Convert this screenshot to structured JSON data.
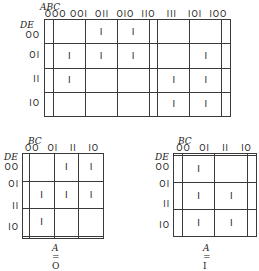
{
  "maps": [
    {
      "id": "five-variable",
      "col_var": "ABC",
      "row_var": "DE",
      "col_labels": [
        "OOO",
        "OOI",
        "OII",
        "OIO",
        "IIO",
        "III",
        "IOI",
        "IOO"
      ],
      "row_labels": [
        "OO",
        "OI",
        "II",
        "IO"
      ],
      "cells": [
        [
          "",
          "",
          "I",
          "I",
          "",
          "",
          "",
          ""
        ],
        [
          "",
          "I",
          "I",
          "I",
          "",
          "",
          "I",
          ""
        ],
        [
          "",
          "I",
          "",
          "",
          "",
          "I",
          "I",
          ""
        ],
        [
          "",
          "",
          "",
          "",
          "",
          "I",
          "I",
          ""
        ]
      ],
      "caption": ""
    },
    {
      "id": "a-equals-0",
      "col_var": "BC",
      "row_var": "DE",
      "col_labels": [
        "OO",
        "OI",
        "II",
        "IO"
      ],
      "row_labels": [
        "OO",
        "OI",
        "II",
        "IO"
      ],
      "cells": [
        [
          "",
          "",
          "I",
          "I"
        ],
        [
          "",
          "I",
          "I",
          "I"
        ],
        [
          "",
          "I",
          "",
          ""
        ],
        [
          "",
          "",
          "",
          ""
        ]
      ],
      "caption_var": "A",
      "caption_eq": " = O"
    },
    {
      "id": "a-equals-1",
      "col_var": "BC",
      "row_var": "DE",
      "col_labels": [
        "OO",
        "OI",
        "II",
        "IO"
      ],
      "row_labels": [
        "OO",
        "OI",
        "II",
        "IO"
      ],
      "cells": [
        [
          "",
          "",
          "",
          ""
        ],
        [
          "",
          "I",
          "",
          ""
        ],
        [
          "",
          "I",
          "I",
          ""
        ],
        [
          "",
          "I",
          "I",
          ""
        ]
      ],
      "caption_var": "A",
      "caption_eq": " = I"
    }
  ]
}
